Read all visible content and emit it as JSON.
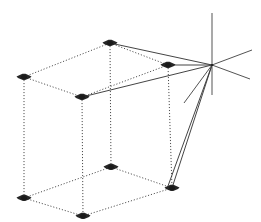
{
  "figure": {
    "background_color": "#ffffff",
    "line_color": "#2b2b2b",
    "ray_color": "#3a3a3a",
    "axis_color": "#4a4a4a",
    "marker_color": "#1a1a1a",
    "width": 261,
    "height": 222
  },
  "chart_data": {
    "type": "scatter",
    "xlabel": "",
    "ylabel": "",
    "xlim": [
      0,
      261
    ],
    "ylim": [
      0,
      222
    ],
    "grid": false,
    "legend": "none",
    "annotations": [
      "8 cube vertices marked with dark markers",
      "Cube edges drawn as dotted lines",
      "Solid rays converge at projection center on the right",
      "Three coordinate axes radiate from the projection center"
    ],
    "series": [
      {
        "name": "cube-vertices",
        "points": [
          {
            "label": "top-back-left",
            "x": 24,
            "y": 77
          },
          {
            "label": "top-back-right",
            "x": 110,
            "y": 43
          },
          {
            "label": "top-front-left",
            "x": 82,
            "y": 97
          },
          {
            "label": "top-front-right",
            "x": 168,
            "y": 65
          },
          {
            "label": "bottom-back-left",
            "x": 24,
            "y": 198
          },
          {
            "label": "bottom-back-right",
            "x": 111,
            "y": 167
          },
          {
            "label": "bottom-front-left",
            "x": 83,
            "y": 216
          },
          {
            "label": "bottom-front-right",
            "x": 172,
            "y": 188
          }
        ]
      },
      {
        "name": "projection-center",
        "points": [
          {
            "label": "camera-center",
            "x": 212,
            "y": 65
          }
        ]
      }
    ],
    "edges": [
      {
        "name": "top-face-back-left-to-back-right",
        "from": "top-back-left",
        "to": "top-back-right",
        "style": "dotted"
      },
      {
        "name": "top-face-back-right-to-front-right",
        "from": "top-back-right",
        "to": "top-front-right",
        "style": "dotted"
      },
      {
        "name": "top-face-front-right-to-front-left",
        "from": "top-front-right",
        "to": "top-front-left",
        "style": "dotted"
      },
      {
        "name": "top-face-front-left-to-back-left",
        "from": "top-front-left",
        "to": "top-back-left",
        "style": "dotted"
      },
      {
        "name": "bottom-face-back-left-to-back-right",
        "from": "bottom-back-left",
        "to": "bottom-back-right",
        "style": "dotted"
      },
      {
        "name": "bottom-face-back-right-to-front-right",
        "from": "bottom-back-right",
        "to": "bottom-front-right",
        "style": "dotted"
      },
      {
        "name": "bottom-face-front-right-to-front-left",
        "from": "bottom-front-right",
        "to": "bottom-front-left",
        "style": "dotted"
      },
      {
        "name": "bottom-face-front-left-to-back-left",
        "from": "bottom-front-left",
        "to": "bottom-back-left",
        "style": "dotted"
      },
      {
        "name": "vertical-back-left",
        "from": "top-back-left",
        "to": "bottom-back-left",
        "style": "dotted"
      },
      {
        "name": "vertical-back-right",
        "from": "top-back-right",
        "to": "bottom-back-right",
        "style": "dotted"
      },
      {
        "name": "vertical-front-left",
        "from": "top-front-left",
        "to": "bottom-front-left",
        "style": "dotted"
      },
      {
        "name": "vertical-front-right",
        "from": "top-front-right",
        "to": "bottom-front-right",
        "style": "dotted"
      }
    ],
    "rays": [
      {
        "name": "ray-to-top-back-right",
        "from": "camera-center",
        "to": "top-back-right"
      },
      {
        "name": "ray-to-top-front-right",
        "from": "camera-center",
        "to": "top-front-right"
      },
      {
        "name": "ray-to-top-front-left",
        "from": "camera-center",
        "to": "top-front-left"
      },
      {
        "name": "ray-to-bottom-front-right",
        "from": "camera-center",
        "to": "bottom-front-right"
      },
      {
        "name": "ray-to-bottom-back-right",
        "from": "camera-center",
        "to": "bottom-front-right-secondary"
      }
    ],
    "axes": [
      {
        "name": "axis-vertical",
        "x1": 212,
        "y1": 13,
        "x2": 212,
        "y2": 95
      },
      {
        "name": "axis-upper-right",
        "x1": 212,
        "y1": 65,
        "x2": 252,
        "y2": 50
      },
      {
        "name": "axis-lower-right",
        "x1": 212,
        "y1": 65,
        "x2": 250,
        "y2": 79
      },
      {
        "name": "axis-lower-left",
        "x1": 212,
        "y1": 65,
        "x2": 184,
        "y2": 103
      }
    ]
  }
}
